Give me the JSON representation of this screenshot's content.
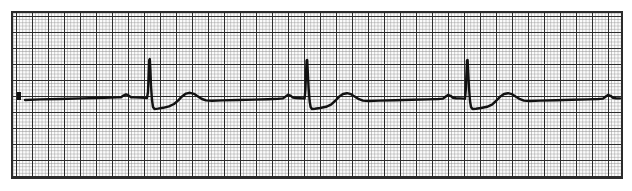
{
  "document": {
    "title": "ECG Rhythm Strip",
    "kind": "electrocardiogram-paper-tracing",
    "background_color": "#ffffff"
  },
  "canvas": {
    "width": 632,
    "height": 191
  },
  "grid": {
    "x": 12,
    "y": 12,
    "width": 610,
    "height": 166,
    "small_box_px": 3.2,
    "large_box_px": 16.0,
    "small_line_color": "#8c8c8c",
    "large_line_color": "#2b2b2b",
    "paper_color": "#fbfbfb",
    "small_line_width": 0.55,
    "large_line_width": 1.15
  },
  "trace": {
    "color": "#111111",
    "stroke_width": 2.4,
    "baseline_y": 99,
    "start_x": 25,
    "end_x": 620,
    "label": "lead-ii-rhythm",
    "rhythm": "normal sinus rhythm, slow rate",
    "beats": [
      {
        "index": 1,
        "p_x": 126,
        "qrs_x": 149,
        "t_x": 188,
        "r_peak_y": 59,
        "s_trough_y": 109
      },
      {
        "index": 2,
        "p_x": 289,
        "qrs_x": 306,
        "t_x": 345,
        "r_peak_y": 60,
        "s_trough_y": 109
      },
      {
        "index": 3,
        "p_x": 448,
        "qrs_x": 466,
        "t_x": 505,
        "r_peak_y": 60,
        "s_trough_y": 109
      },
      {
        "index": 4,
        "p_x": 608,
        "qrs_x": null,
        "t_x": null,
        "r_peak_y": null,
        "s_trough_y": null
      }
    ],
    "path": "M 25,100 L 40,99.4 L 60,99 L 82,98.4 L 104,97.8 L 118,97.4 L 121,97.2 L 123.5,95.6 L 126,94.4 L 128.5,95.4 L 131,97.2 L 134,97.4 L 140,97.6 L 145,97.8 L 147,98 L 148,92 L 148.6,76 L 149.2,60 L 149.8,59 L 150.4,70 L 151,86 L 152,100 L 153,107 L 154.5,109 L 158,108.6 L 163,107.8 L 169,106.4 L 174,104 L 178,100.6 L 182,96.4 L 186,93.6 L 190,92.8 L 194,93.8 L 198,96.4 L 202,99 L 206,100.4 L 212,100.8 L 222,100.4 L 238,100 L 254,99.6 L 268,99.2 L 278,98.8 L 283,98.4 L 285.5,96.6 L 288,94.8 L 290.5,95.6 L 293,97.6 L 296,98 L 300,98.2 L 303,98.4 L 304.6,98.6 L 305.4,90 L 306,74 L 306.6,60.5 L 307.2,60 L 307.8,72 L 308.6,88 L 309.6,101 L 310.6,107 L 312,109 L 315,108.8 L 320,108 L 326,106.8 L 331,104.6 L 335,101 L 339,96.8 L 343,94 L 347,93.2 L 351,94.2 L 355,96.8 L 359,99.2 L 363,100.6 L 369,101 L 379,100.6 L 395,100.2 L 412,99.8 L 428,99.4 L 438,99 L 443,98.6 L 445.5,96.8 L 448,95 L 450.5,95.8 L 453,97.8 L 456,98.2 L 460,98.4 L 464,98.6 L 465,98.8 L 465.8,90 L 466.4,74 L 467,60.5 L 467.6,60 L 468.2,72 L 469,88 L 470,101 L 471,107 L 472.5,109 L 476,108.8 L 481,108 L 487,106.8 L 492,104.6 L 496,101 L 500,96.8 L 504,94 L 508,93.2 L 512,94.2 L 516,96.8 L 520,99.2 L 524,100.6 L 530,101 L 540,100.6 L 556,100.2 L 572,99.8 L 588,99.4 L 598,99 L 603,98.6 L 605.5,96.8 L 608,95 L 610.5,95.8 L 613,97.8 L 616,98.2 L 620,98.4"
  },
  "calibration_mark": {
    "present": true,
    "x": 17,
    "y": 92,
    "width": 4,
    "height": 8,
    "color": "#111111"
  }
}
